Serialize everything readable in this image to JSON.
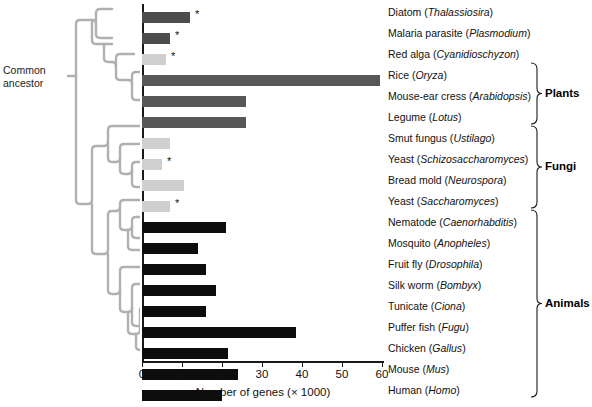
{
  "figure": {
    "ancestor_label": "Common\nancestor",
    "ancestor_label_line1": "Common",
    "ancestor_label_line2": "ancestor"
  },
  "chart_data": {
    "type": "bar",
    "orientation": "horizontal",
    "title": "",
    "xlabel": "Number of genes (× 1000)",
    "ylabel": "",
    "xlim": [
      0,
      60
    ],
    "xticks": [
      0,
      10,
      20,
      30,
      40,
      50,
      60
    ],
    "xtick_labels": [
      "0",
      "10",
      "20",
      "30",
      "40",
      "50",
      "60"
    ],
    "grid": false,
    "legend": false,
    "units": "thousands of genes",
    "note": "Asterisk (*) marks species whose complete genome sequence is available",
    "categories": [
      "Diatom (Thalassiosira)",
      "Malaria parasite (Plasmodium)",
      "Red alga (Cyanidioschyzon)",
      "Rice (Oryza)",
      "Mouse-ear cress (Arabidopsis)",
      "Legume (Lotus)",
      "Smut fungus (Ustilago)",
      "Yeast (Schizosaccharomyces)",
      "Bread mold (Neurospora)",
      "Yeast (Saccharomyces)",
      "Nematode (Caenorhabditis)",
      "Mosquito (Anopheles)",
      "Fruit fly (Drosophila)",
      "Silk worm (Bombyx)",
      "Tunicate (Ciona)",
      "Puffer fish (Fugu)",
      "Chicken (Gallus)",
      "Mouse (Mus)",
      "Human (Homo)"
    ],
    "values": [
      12,
      7,
      6,
      59.5,
      26,
      26,
      7,
      5,
      10.5,
      7,
      21,
      14,
      16,
      18.5,
      16,
      38.5,
      21.5,
      24,
      20
    ],
    "bars": [
      {
        "common": "Diatom",
        "genus": "Thalassiosira",
        "value": 12,
        "color": "#4d4d4d",
        "group": "",
        "starred": true
      },
      {
        "common": "Malaria parasite",
        "genus": "Plasmodium",
        "value": 7,
        "color": "#4d4d4d",
        "group": "",
        "starred": true
      },
      {
        "common": "Red alga",
        "genus": "Cyanidioschyzon",
        "value": 6,
        "color": "#cfcfcf",
        "group": "",
        "starred": true
      },
      {
        "common": "Rice",
        "genus": "Oryza",
        "value": 59.5,
        "color": "#575757",
        "group": "Plants",
        "starred": false
      },
      {
        "common": "Mouse-ear cress",
        "genus": "Arabidopsis",
        "value": 26,
        "color": "#575757",
        "group": "Plants",
        "starred": false
      },
      {
        "common": "Legume",
        "genus": "Lotus",
        "value": 26,
        "color": "#575757",
        "group": "Plants",
        "starred": false
      },
      {
        "common": "Smut fungus",
        "genus": "Ustilago",
        "value": 7,
        "color": "#cfcfcf",
        "group": "Fungi",
        "starred": false
      },
      {
        "common": "Yeast",
        "genus": "Schizosaccharomyces",
        "value": 5,
        "color": "#cfcfcf",
        "group": "Fungi",
        "starred": true
      },
      {
        "common": "Bread mold",
        "genus": "Neurospora",
        "value": 10.5,
        "color": "#cfcfcf",
        "group": "Fungi",
        "starred": false
      },
      {
        "common": "Yeast",
        "genus": "Saccharomyces",
        "value": 7,
        "color": "#cfcfcf",
        "group": "Fungi",
        "starred": true
      },
      {
        "common": "Nematode",
        "genus": "Caenorhabditis",
        "value": 21,
        "color": "#0d0d0d",
        "group": "Animals",
        "starred": false
      },
      {
        "common": "Mosquito",
        "genus": "Anopheles",
        "value": 14,
        "color": "#0d0d0d",
        "group": "Animals",
        "starred": false
      },
      {
        "common": "Fruit fly",
        "genus": "Drosophila",
        "value": 16,
        "color": "#0d0d0d",
        "group": "Animals",
        "starred": false
      },
      {
        "common": "Silk worm",
        "genus": "Bombyx",
        "value": 18.5,
        "color": "#0d0d0d",
        "group": "Animals",
        "starred": false
      },
      {
        "common": "Tunicate",
        "genus": "Ciona",
        "value": 16,
        "color": "#0d0d0d",
        "group": "Animals",
        "starred": false
      },
      {
        "common": "Puffer fish",
        "genus": "Fugu",
        "value": 38.5,
        "color": "#0d0d0d",
        "group": "Animals",
        "starred": false
      },
      {
        "common": "Chicken",
        "genus": "Gallus",
        "value": 21.5,
        "color": "#0d0d0d",
        "group": "Animals",
        "starred": false
      },
      {
        "common": "Mouse",
        "genus": "Mus",
        "value": 24,
        "color": "#0d0d0d",
        "group": "Animals",
        "starred": false
      },
      {
        "common": "Human",
        "genus": "Homo",
        "value": 20,
        "color": "#0d0d0d",
        "group": "Animals",
        "starred": false
      }
    ],
    "groups": [
      {
        "name": "Plants",
        "first_row": 3,
        "last_row": 5
      },
      {
        "name": "Fungi",
        "first_row": 6,
        "last_row": 9
      },
      {
        "name": "Animals",
        "first_row": 10,
        "last_row": 18
      }
    ],
    "colors": {
      "protist_dark": "#4d4d4d",
      "plant": "#575757",
      "fungi_light": "#cfcfcf",
      "animal_black": "#0d0d0d",
      "tree": "#b0b0b0",
      "axis": "#1a1a1a"
    }
  }
}
